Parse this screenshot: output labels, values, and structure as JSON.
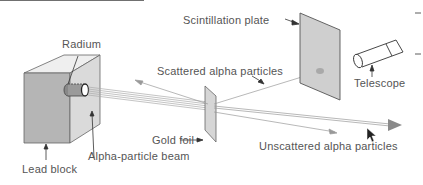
{
  "diagram": {
    "labels": {
      "radium": "Radium",
      "lead_block": "Lead block",
      "alpha_beam": "Alpha-particle beam",
      "gold_foil": "Gold foil",
      "scattered": "Scattered alpha particles",
      "unscattered": "Unscattered alpha particles",
      "scintillation_plate": "Scintillation plate",
      "telescope": "Telescope"
    },
    "colors": {
      "text": "#555555",
      "line": "#777777",
      "block_front": "#b8b8b8",
      "block_side": "#dcdcdc",
      "block_top": "#efefef",
      "plate": "#cfcfcf",
      "foil": "#d6d6d6",
      "arrowhead": "#8a8a8a"
    }
  }
}
